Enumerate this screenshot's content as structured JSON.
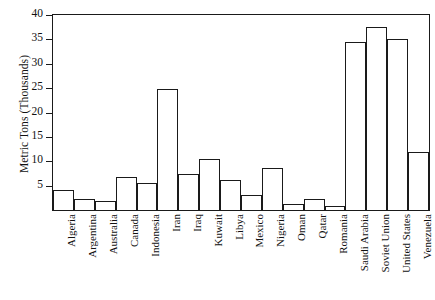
{
  "chart_data": {
    "type": "bar",
    "title": "",
    "xlabel": "",
    "ylabel": "Metric Tons (Thousands)",
    "ylim": [
      0,
      40
    ],
    "yticks": [
      5,
      10,
      15,
      20,
      25,
      30,
      35,
      40
    ],
    "grid": false,
    "legend": null,
    "categories": [
      "Algeria",
      "Argentina",
      "Australia",
      "Canada",
      "Indonesia",
      "Iran",
      "Iraq",
      "Kuwait",
      "Libya",
      "Mexico",
      "Nigeria",
      "Oman",
      "Qatar",
      "Romania",
      "Saudi Arabia",
      "Soviet Union",
      "United States",
      "Venezuela"
    ],
    "values": [
      4.2,
      2.3,
      1.8,
      6.8,
      5.5,
      24.8,
      7.3,
      10.5,
      6.2,
      3.1,
      8.7,
      1.3,
      2.2,
      0.9,
      34.5,
      37.5,
      35.0,
      12.0
    ]
  },
  "style": {
    "bar_fill": "#ffffff",
    "bar_stroke": "#1a1a1a",
    "axis_color": "#1a1a1a",
    "text_color": "#111111"
  }
}
